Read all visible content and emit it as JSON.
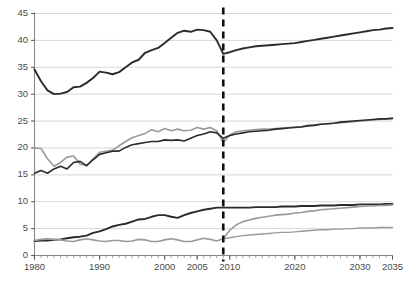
{
  "chart_data": {
    "type": "line",
    "title": "",
    "subtitle": "",
    "xlabel": "",
    "ylabel": "",
    "xlim": [
      1980,
      2035
    ],
    "ylim": [
      0,
      45
    ],
    "grid": true,
    "gridlines_axis": "y",
    "legend_position": "none",
    "y_ticks": [
      0,
      5,
      10,
      15,
      20,
      25,
      30,
      35,
      40,
      45
    ],
    "y_tick_labels": [
      "0",
      "5",
      "10",
      "15",
      "20",
      "25",
      "30",
      "35",
      "40",
      "45"
    ],
    "x_ticks": [
      1980,
      1990,
      2000,
      2005,
      2010,
      2020,
      2030,
      2035
    ],
    "x_tick_labels": [
      "1980",
      "1990",
      "2000",
      "2005",
      "2010",
      "2020",
      "2030",
      "2035"
    ],
    "x_minor_tick_interval": 1,
    "annotations": [
      {
        "name": "projection-divider",
        "type": "vline",
        "x": 2009,
        "style": "dashed",
        "color": "#111111",
        "width": 2.6,
        "label": ""
      }
    ],
    "colors": {
      "dark": "#2b2b2b",
      "gray": "#9a9a9a",
      "grid": "#d2d2d2",
      "axis": "#8a8a8a",
      "divider": "#111111"
    },
    "series": [
      {
        "name": "top-dark-series",
        "color": "#2b2b2b",
        "width": 1.9,
        "x": [
          1980,
          1981,
          1982,
          1983,
          1984,
          1985,
          1986,
          1987,
          1988,
          1989,
          1990,
          1991,
          1992,
          1993,
          1994,
          1995,
          1996,
          1997,
          1998,
          1999,
          2000,
          2001,
          2002,
          2003,
          2004,
          2005,
          2006,
          2007,
          2008,
          2009,
          2010,
          2011,
          2012,
          2013,
          2014,
          2015,
          2016,
          2017,
          2018,
          2019,
          2020,
          2021,
          2022,
          2023,
          2024,
          2025,
          2026,
          2027,
          2028,
          2029,
          2030,
          2031,
          2032,
          2033,
          2034,
          2035
        ],
        "values": [
          34.6,
          32.4,
          30.7,
          30.0,
          30.1,
          30.4,
          31.3,
          31.4,
          32.1,
          33.0,
          34.2,
          34.0,
          33.7,
          34.1,
          35.0,
          35.9,
          36.4,
          37.7,
          38.2,
          38.6,
          39.5,
          40.5,
          41.4,
          41.8,
          41.6,
          42.0,
          41.9,
          41.6,
          40.0,
          37.5,
          37.8,
          38.2,
          38.5,
          38.7,
          38.9,
          39.0,
          39.1,
          39.2,
          39.3,
          39.4,
          39.5,
          39.7,
          39.9,
          40.1,
          40.3,
          40.5,
          40.7,
          40.9,
          41.1,
          41.3,
          41.5,
          41.7,
          41.9,
          42.0,
          42.2,
          42.3
        ]
      },
      {
        "name": "middle-gray-series",
        "color": "#9a9a9a",
        "width": 1.6,
        "x": [
          1980,
          1981,
          1982,
          1983,
          1984,
          1985,
          1986,
          1987,
          1988,
          1989,
          1990,
          1991,
          1992,
          1993,
          1994,
          1995,
          1996,
          1997,
          1998,
          1999,
          2000,
          2001,
          2002,
          2003,
          2004,
          2005,
          2006,
          2007,
          2008,
          2009,
          2010,
          2011,
          2012,
          2013,
          2014,
          2015,
          2016,
          2017,
          2018,
          2019,
          2020,
          2021,
          2022,
          2023,
          2024,
          2025,
          2026,
          2027,
          2028,
          2029,
          2030,
          2031,
          2032,
          2033,
          2034,
          2035
        ],
        "values": [
          20.0,
          19.9,
          18.0,
          16.6,
          17.3,
          18.3,
          18.5,
          17.0,
          16.7,
          18.0,
          19.2,
          19.4,
          19.6,
          20.4,
          21.2,
          21.9,
          22.3,
          22.7,
          23.4,
          23.0,
          23.6,
          23.2,
          23.5,
          23.2,
          23.3,
          23.8,
          23.5,
          23.8,
          23.2,
          21.0,
          22.4,
          23.0,
          23.2,
          23.3,
          23.4,
          23.5,
          23.5,
          23.6,
          23.7,
          23.8,
          23.9,
          24.0,
          24.2,
          24.3,
          24.4,
          24.5,
          24.6,
          24.7,
          24.8,
          24.9,
          25.0,
          25.1,
          25.2,
          25.3,
          25.4,
          25.5
        ]
      },
      {
        "name": "middle-dark-series",
        "color": "#2b2b2b",
        "width": 1.6,
        "x": [
          1980,
          1981,
          1982,
          1983,
          1984,
          1985,
          1986,
          1987,
          1988,
          1989,
          1990,
          1991,
          1992,
          1993,
          1994,
          1995,
          1996,
          1997,
          1998,
          1999,
          2000,
          2001,
          2002,
          2003,
          2004,
          2005,
          2006,
          2007,
          2008,
          2009,
          2010,
          2011,
          2012,
          2013,
          2014,
          2015,
          2016,
          2017,
          2018,
          2019,
          2020,
          2021,
          2022,
          2023,
          2024,
          2025,
          2026,
          2027,
          2028,
          2029,
          2030,
          2031,
          2032,
          2033,
          2034,
          2035
        ],
        "values": [
          15.3,
          15.8,
          15.3,
          16.1,
          16.6,
          16.1,
          17.3,
          17.5,
          16.7,
          17.8,
          18.8,
          19.1,
          19.4,
          19.4,
          20.1,
          20.6,
          20.8,
          21.0,
          21.2,
          21.2,
          21.5,
          21.4,
          21.5,
          21.3,
          21.8,
          22.3,
          22.6,
          23.0,
          22.8,
          21.8,
          22.3,
          22.6,
          22.8,
          23.0,
          23.1,
          23.2,
          23.3,
          23.5,
          23.6,
          23.7,
          23.8,
          23.9,
          24.1,
          24.2,
          24.4,
          24.5,
          24.6,
          24.8,
          24.9,
          25.0,
          25.1,
          25.2,
          25.3,
          25.4,
          25.4,
          25.5
        ]
      },
      {
        "name": "bottom-dark-series",
        "color": "#2b2b2b",
        "width": 1.9,
        "x": [
          1980,
          1981,
          1982,
          1983,
          1984,
          1985,
          1986,
          1987,
          1988,
          1989,
          1990,
          1991,
          1992,
          1993,
          1994,
          1995,
          1996,
          1997,
          1998,
          1999,
          2000,
          2001,
          2002,
          2003,
          2004,
          2005,
          2006,
          2007,
          2008,
          2009,
          2010,
          2011,
          2012,
          2013,
          2014,
          2015,
          2016,
          2017,
          2018,
          2019,
          2020,
          2021,
          2022,
          2023,
          2024,
          2025,
          2026,
          2027,
          2028,
          2029,
          2030,
          2031,
          2032,
          2033,
          2034,
          2035
        ],
        "values": [
          2.7,
          2.8,
          2.8,
          2.9,
          3.0,
          3.2,
          3.4,
          3.5,
          3.7,
          4.2,
          4.5,
          4.9,
          5.4,
          5.7,
          5.9,
          6.3,
          6.7,
          6.8,
          7.2,
          7.5,
          7.5,
          7.2,
          7.0,
          7.5,
          7.9,
          8.2,
          8.5,
          8.7,
          8.9,
          8.9,
          8.9,
          8.9,
          8.9,
          8.9,
          9.0,
          9.0,
          9.0,
          9.0,
          9.1,
          9.1,
          9.1,
          9.2,
          9.2,
          9.2,
          9.3,
          9.3,
          9.3,
          9.4,
          9.4,
          9.4,
          9.5,
          9.5,
          9.5,
          9.5,
          9.6,
          9.6
        ]
      },
      {
        "name": "bottom-gray-rising-series",
        "color": "#9a9a9a",
        "width": 1.6,
        "x": [
          1980,
          1981,
          1982,
          1983,
          1984,
          1985,
          1986,
          1987,
          1988,
          1989,
          1990,
          1991,
          1992,
          1993,
          1994,
          1995,
          1996,
          1997,
          1998,
          1999,
          2000,
          2001,
          2002,
          2003,
          2004,
          2005,
          2006,
          2007,
          2008,
          2009,
          2010,
          2011,
          2012,
          2013,
          2014,
          2015,
          2016,
          2017,
          2018,
          2019,
          2020,
          2021,
          2022,
          2023,
          2024,
          2025,
          2026,
          2027,
          2028,
          2029,
          2030,
          2031,
          2032,
          2033,
          2034,
          2035
        ],
        "values": [
          2.8,
          3.0,
          3.1,
          3.0,
          2.9,
          2.7,
          2.6,
          2.9,
          3.1,
          2.9,
          2.7,
          2.6,
          2.8,
          2.8,
          2.6,
          2.7,
          3.0,
          2.9,
          2.6,
          2.6,
          2.9,
          3.1,
          2.9,
          2.6,
          2.6,
          2.9,
          3.2,
          3.0,
          2.7,
          3.1,
          4.7,
          5.7,
          6.3,
          6.6,
          6.9,
          7.1,
          7.3,
          7.5,
          7.6,
          7.7,
          7.9,
          8.0,
          8.2,
          8.3,
          8.5,
          8.6,
          8.7,
          8.8,
          8.9,
          9.0,
          9.1,
          9.2,
          9.2,
          9.3,
          9.3,
          9.4
        ]
      },
      {
        "name": "bottom-gray-flat-series",
        "color": "#9a9a9a",
        "width": 1.4,
        "x": [
          2009,
          2010,
          2011,
          2012,
          2013,
          2014,
          2015,
          2016,
          2017,
          2018,
          2019,
          2020,
          2021,
          2022,
          2023,
          2024,
          2025,
          2026,
          2027,
          2028,
          2029,
          2030,
          2031,
          2032,
          2033,
          2034,
          2035
        ],
        "values": [
          3.1,
          3.3,
          3.5,
          3.7,
          3.8,
          3.9,
          4.0,
          4.1,
          4.2,
          4.3,
          4.3,
          4.4,
          4.5,
          4.6,
          4.7,
          4.8,
          4.8,
          4.9,
          4.9,
          5.0,
          5.0,
          5.1,
          5.1,
          5.1,
          5.2,
          5.2,
          5.2
        ]
      }
    ]
  }
}
